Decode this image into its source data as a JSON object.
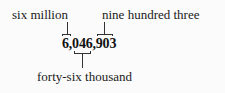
{
  "diagram": {
    "number": "6,046,903",
    "labels": {
      "millions": "six million",
      "ones": "nine hundred three",
      "thousands": "forty-six thousand"
    }
  }
}
